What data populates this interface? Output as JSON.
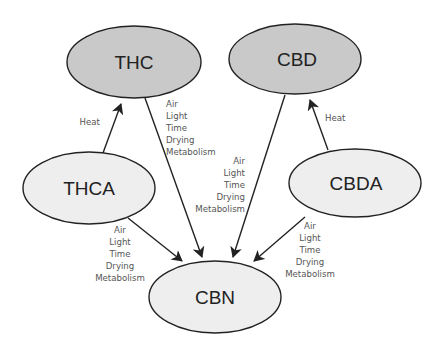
{
  "diagram": {
    "colors": {
      "product_fill": "#c9c9c9",
      "precursor_fill": "#eeeeee",
      "stroke": "#222222",
      "label_text": "#555555"
    },
    "nodes": {
      "thc": {
        "label": "THC",
        "type": "product"
      },
      "cbd": {
        "label": "CBD",
        "type": "product"
      },
      "thca": {
        "label": "THCA",
        "type": "precursor"
      },
      "cbda": {
        "label": "CBDA",
        "type": "precursor"
      },
      "cbn": {
        "label": "CBN",
        "type": "precursor"
      }
    },
    "edges": {
      "thca_to_thc": {
        "from": "THCA",
        "to": "THC",
        "labels": [
          "Heat"
        ]
      },
      "cbda_to_cbd": {
        "from": "CBDA",
        "to": "CBD",
        "labels": [
          "Heat"
        ]
      },
      "thc_to_cbn": {
        "from": "THC",
        "to": "CBN",
        "labels": [
          "Air",
          "Light",
          "Time",
          "Drying",
          "Metabolism"
        ]
      },
      "cbd_to_cbn": {
        "from": "CBD",
        "to": "CBN",
        "labels": [
          "Air",
          "Light",
          "Time",
          "Drying",
          "Metabolism"
        ]
      },
      "thca_to_cbn": {
        "from": "THCA",
        "to": "CBN",
        "labels": [
          "Air",
          "Light",
          "Time",
          "Drying",
          "Metabolism"
        ]
      },
      "cbda_to_cbn": {
        "from": "CBDA",
        "to": "CBN",
        "labels": [
          "Air",
          "Light",
          "Time",
          "Drying",
          "Metabolism"
        ]
      }
    }
  }
}
